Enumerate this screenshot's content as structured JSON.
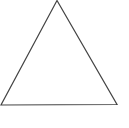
{
  "diagram": {
    "shape": "triangle",
    "type": "equilateral-outline",
    "stroke_color": "#444444",
    "fill_color": "#ffffff",
    "background_color": "#ffffff",
    "stroke_width": 1.2,
    "vertices": {
      "apex": [
        57,
        0.5
      ],
      "bottom_left": [
        1,
        105
      ],
      "bottom_right": [
        117,
        104.5
      ]
    }
  }
}
